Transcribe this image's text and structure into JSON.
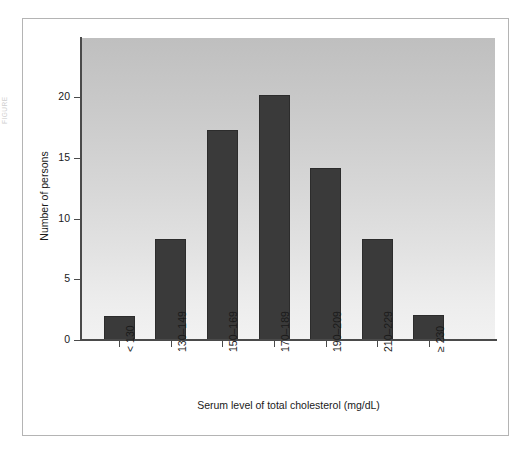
{
  "margin_note": "FIGURE",
  "chart_data": {
    "type": "bar",
    "title": "",
    "subtitle": "",
    "xlabel": "Serum level of total cholesterol (mg/dL)",
    "ylabel": "Number of persons",
    "categories": [
      "< 130",
      "130–149",
      "150–169",
      "170–189",
      "190–209",
      "210–229",
      "≥ 230"
    ],
    "values": [
      2,
      8.3,
      17.3,
      20.2,
      14.2,
      8.3,
      2.1
    ],
    "ylim": [
      0,
      24.9
    ],
    "yticks": [
      0,
      5,
      10,
      15,
      20
    ],
    "ytick_labels": [
      "0",
      "5",
      "10",
      "15",
      "20"
    ],
    "grid": false,
    "legend": "none",
    "bar_color": "#3a3a3a",
    "plot_background": "#d8d8d8",
    "axis_color": "#4a4a4a"
  }
}
